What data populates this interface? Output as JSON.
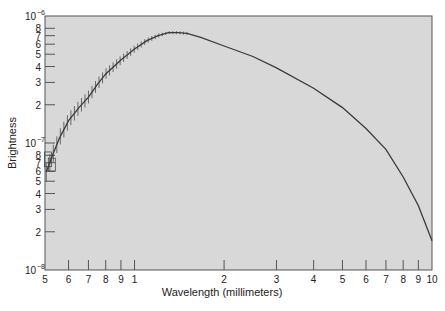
{
  "chart_data": {
    "type": "line",
    "title": "",
    "xlabel": "Wavelength (millimeters)",
    "ylabel": "Brightness",
    "xscale": "log",
    "yscale": "log",
    "xlim": [
      0.5,
      10
    ],
    "ylim": [
      1e-08,
      1e-06
    ],
    "grid": false,
    "legend": null,
    "x_ticks": [
      {
        "value": 0.5,
        "label": "5"
      },
      {
        "value": 0.6,
        "label": "6"
      },
      {
        "value": 0.7,
        "label": "7"
      },
      {
        "value": 0.8,
        "label": "8"
      },
      {
        "value": 0.9,
        "label": "9"
      },
      {
        "value": 1,
        "label": "1"
      },
      {
        "value": 2,
        "label": "2"
      },
      {
        "value": 3,
        "label": "3"
      },
      {
        "value": 4,
        "label": "4"
      },
      {
        "value": 5,
        "label": "5"
      },
      {
        "value": 6,
        "label": "6"
      },
      {
        "value": 7,
        "label": "7"
      },
      {
        "value": 8,
        "label": "8"
      },
      {
        "value": 9,
        "label": "9"
      },
      {
        "value": 10,
        "label": "10"
      }
    ],
    "y_ticks": [
      {
        "value": 1e-08,
        "label": "10",
        "exp": "-8",
        "major": true
      },
      {
        "value": 2e-08,
        "label": "2"
      },
      {
        "value": 3e-08,
        "label": "3"
      },
      {
        "value": 4e-08,
        "label": "4"
      },
      {
        "value": 5e-08,
        "label": "5"
      },
      {
        "value": 6e-08,
        "label": "6"
      },
      {
        "value": 7e-08,
        "label": "7"
      },
      {
        "value": 8e-08,
        "label": "8"
      },
      {
        "value": 1e-07,
        "label": "10",
        "exp": "-7",
        "major": true
      },
      {
        "value": 2e-07,
        "label": "2"
      },
      {
        "value": 3e-07,
        "label": "3"
      },
      {
        "value": 4e-07,
        "label": "4"
      },
      {
        "value": 5e-07,
        "label": "5"
      },
      {
        "value": 6e-07,
        "label": "6"
      },
      {
        "value": 7e-07,
        "label": "7"
      },
      {
        "value": 8e-07,
        "label": "8"
      },
      {
        "value": 1e-06,
        "label": "10",
        "exp": "-6",
        "major": true
      }
    ],
    "series": [
      {
        "name": "Brightness",
        "x": [
          0.505,
          0.53,
          0.56,
          0.6,
          0.65,
          0.7,
          0.75,
          0.8,
          0.9,
          1.0,
          1.1,
          1.2,
          1.3,
          1.4,
          1.5,
          1.67,
          2.0,
          2.5,
          3.0,
          4.0,
          5.0,
          6.0,
          7.0,
          8.0,
          9.0,
          10.0
        ],
        "y": [
          5.9e-08,
          8e-08,
          1.1e-07,
          1.5e-07,
          1.9e-07,
          2.3e-07,
          2.9e-07,
          3.5e-07,
          4.5e-07,
          5.5e-07,
          6.4e-07,
          7e-07,
          7.4e-07,
          7.4e-07,
          7.3e-07,
          6.8e-07,
          5.8e-07,
          4.8e-07,
          3.9e-07,
          2.7e-07,
          1.9e-07,
          1.3e-07,
          8.9e-08,
          5.4e-08,
          3.2e-08,
          1.7e-08
        ],
        "error_bars_region": [
          0.5,
          1.5
        ]
      }
    ]
  },
  "colors": {
    "plot_background": "#d8d8d8",
    "curve": "#3a3a3a",
    "axis": "#555555",
    "text": "#222222"
  }
}
